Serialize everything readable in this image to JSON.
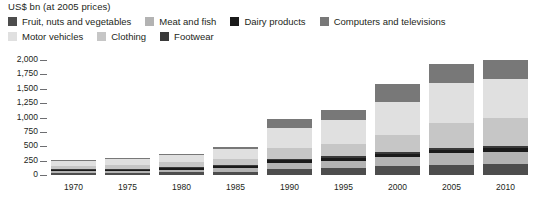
{
  "axis_title": "US$ bn (at 2005 prices)",
  "legend": {
    "rows": [
      [
        {
          "label": "Fruit, nuts and vegetables",
          "color": "#4d4d4d"
        },
        {
          "label": "Meat and fish",
          "color": "#b3b3b3"
        },
        {
          "label": "Dairy products",
          "color": "#1a1a1a"
        },
        {
          "label": "Computers and televisions",
          "color": "#787878"
        }
      ],
      [
        {
          "label": "Motor vehicles",
          "color": "#e0e0e0"
        },
        {
          "label": "Clothing",
          "color": "#c6c6c6"
        },
        {
          "label": "Footwear",
          "color": "#3a3a3a"
        }
      ]
    ]
  },
  "chart_data": {
    "type": "bar",
    "stacked": true,
    "title": "",
    "xlabel": "",
    "ylabel": "US$ bn (at 2005 prices)",
    "ylim": [
      0,
      2000
    ],
    "ytick_values": [
      0,
      250,
      500,
      750,
      1000,
      1250,
      1500,
      1750,
      2000
    ],
    "ytick_labels": [
      "0",
      "250",
      "500",
      "750",
      "1,000",
      "1,250",
      "1,500",
      "1,750",
      "2,000"
    ],
    "grid": false,
    "legend_position": "top",
    "categories": [
      "1970",
      "1975",
      "1980",
      "1985",
      "1990",
      "1995",
      "2000",
      "2005",
      "2010"
    ],
    "series": [
      {
        "name": "Fruit, nuts and vegetables",
        "color": "#4d4d4d",
        "values": [
          30,
          35,
          45,
          60,
          105,
          120,
          150,
          180,
          190
        ]
      },
      {
        "name": "Meat and fish",
        "color": "#b3b3b3",
        "values": [
          35,
          40,
          50,
          65,
          110,
          130,
          165,
          200,
          215
        ]
      },
      {
        "name": "Dairy products",
        "color": "#1a1a1a",
        "values": [
          15,
          18,
          22,
          28,
          40,
          45,
          55,
          60,
          62
        ]
      },
      {
        "name": "Footwear",
        "color": "#3a3a3a",
        "values": [
          10,
          12,
          14,
          18,
          25,
          28,
          32,
          38,
          40
        ]
      },
      {
        "name": "Clothing",
        "color": "#c6c6c6",
        "values": [
          60,
          70,
          85,
          110,
          185,
          215,
          300,
          420,
          480
        ]
      },
      {
        "name": "Motor vehicles",
        "color": "#e0e0e0",
        "values": [
          90,
          105,
          130,
          165,
          360,
          420,
          560,
          700,
          690
        ]
      },
      {
        "name": "Computers and televisions",
        "color": "#787878",
        "values": [
          10,
          15,
          24,
          34,
          145,
          182,
          318,
          332,
          323
        ]
      }
    ],
    "totals": [
      250,
      295,
      370,
      480,
      970,
      1140,
      1580,
      1930,
      2000
    ]
  }
}
